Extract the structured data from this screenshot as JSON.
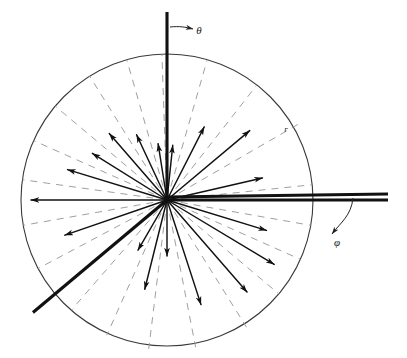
{
  "figure": {
    "type": "polar-vector-diagram",
    "title": "",
    "background_color": "#ffffff",
    "width": 407,
    "height": 358
  },
  "labels": {
    "theta": "θ",
    "phi": "φ",
    "radius": "r"
  },
  "colors": {
    "stroke": "#111111",
    "circle": "#3a3a3a",
    "dashed": "#9a9a9a",
    "axis": "#111111",
    "label": "#1a1a1a"
  },
  "chart_data": {
    "type": "scatter",
    "title": "",
    "xlabel": "φ",
    "ylabel": "θ",
    "grid": false,
    "legend": null,
    "center": {
      "x": 167,
      "y": 200
    },
    "boundary_circle": {
      "cx": 167,
      "cy": 200,
      "r": 146
    },
    "axes": [
      {
        "name": "theta-axis",
        "label": "θ",
        "orientation": "vertical",
        "from": {
          "x": 167,
          "y": 12
        },
        "to": {
          "x": 167,
          "y": 200
        },
        "label_pos": {
          "x": 199,
          "y": 31
        },
        "arc_arrow": {
          "from": {
            "x": 170,
            "y": 27
          },
          "to": {
            "x": 193,
            "y": 29
          }
        }
      },
      {
        "name": "phi-axis",
        "label": "φ",
        "orientation": "horizontal",
        "from": {
          "x": 167,
          "y": 197
        },
        "to": {
          "x": 388,
          "y": 194
        },
        "label_pos": {
          "x": 337,
          "y": 243
        },
        "arc_arrow": {
          "from": {
            "x": 353,
            "y": 198
          },
          "to": {
            "x": 332,
            "y": 234
          }
        }
      }
    ],
    "radius_marker": {
      "label": "r",
      "pos": {
        "x": 286,
        "y": 130
      },
      "angle_deg": 30
    },
    "comment": "Vectors radiate from the center; angle_deg measured counterclockwise from the +x axis, length_px is the drawn arrow length in pixels.",
    "vectors": [
      {
        "angle_deg": 180.0,
        "length_px": 136,
        "weight": "thin",
        "arrow": true
      },
      {
        "angle_deg": 163.0,
        "length_px": 104,
        "weight": "thin",
        "arrow": true
      },
      {
        "angle_deg": 148.0,
        "length_px": 88,
        "weight": "thin",
        "arrow": true
      },
      {
        "angle_deg": 131.0,
        "length_px": 88,
        "weight": "thin",
        "arrow": true
      },
      {
        "angle_deg": 115.0,
        "length_px": 72,
        "weight": "thin",
        "arrow": true
      },
      {
        "angle_deg": 99.0,
        "length_px": 57,
        "weight": "thin",
        "arrow": true
      },
      {
        "angle_deg": 84.0,
        "length_px": 55,
        "weight": "thin",
        "arrow": true
      },
      {
        "angle_deg": 63.0,
        "length_px": 82,
        "weight": "thin",
        "arrow": true
      },
      {
        "angle_deg": 40.0,
        "length_px": 108,
        "weight": "thin",
        "arrow": true
      },
      {
        "angle_deg": 13.0,
        "length_px": 98,
        "weight": "thin",
        "arrow": true
      },
      {
        "angle_deg": 0.0,
        "length_px": 221,
        "weight": "thick",
        "arrow": false
      },
      {
        "angle_deg": -17.0,
        "length_px": 104,
        "weight": "thin",
        "arrow": true
      },
      {
        "angle_deg": -31.0,
        "length_px": 125,
        "weight": "thin",
        "arrow": true
      },
      {
        "angle_deg": -49.0,
        "length_px": 122,
        "weight": "thin",
        "arrow": true
      },
      {
        "angle_deg": -72.0,
        "length_px": 110,
        "weight": "thin",
        "arrow": true
      },
      {
        "angle_deg": -90.0,
        "length_px": 56,
        "weight": "thin",
        "arrow": true
      },
      {
        "angle_deg": -104.0,
        "length_px": 92,
        "weight": "thin",
        "arrow": true
      },
      {
        "angle_deg": -120.0,
        "length_px": 58,
        "weight": "thin",
        "arrow": true
      },
      {
        "angle_deg": -140.0,
        "length_px": 175,
        "weight": "thick",
        "arrow": false
      },
      {
        "angle_deg": -161.0,
        "length_px": 108,
        "weight": "thin",
        "arrow": true
      }
    ],
    "dashed_rays": [
      {
        "angle_deg": 172.0,
        "length_px": 146
      },
      {
        "angle_deg": 156.0,
        "length_px": 146
      },
      {
        "angle_deg": 140.0,
        "length_px": 146
      },
      {
        "angle_deg": 122.0,
        "length_px": 146
      },
      {
        "angle_deg": 106.0,
        "length_px": 146
      },
      {
        "angle_deg": 92.0,
        "length_px": 146
      },
      {
        "angle_deg": 74.0,
        "length_px": 146
      },
      {
        "angle_deg": 52.0,
        "length_px": 146
      },
      {
        "angle_deg": 30.0,
        "length_px": 152
      },
      {
        "angle_deg": 6.0,
        "length_px": 146
      },
      {
        "angle_deg": -10.0,
        "length_px": 146
      },
      {
        "angle_deg": -24.0,
        "length_px": 146
      },
      {
        "angle_deg": -40.0,
        "length_px": 146
      },
      {
        "angle_deg": -58.0,
        "length_px": 150
      },
      {
        "angle_deg": -79.0,
        "length_px": 150
      },
      {
        "angle_deg": -97.0,
        "length_px": 150
      },
      {
        "angle_deg": -114.0,
        "length_px": 148
      },
      {
        "angle_deg": -131.0,
        "length_px": 146
      },
      {
        "angle_deg": -152.0,
        "length_px": 146
      },
      {
        "angle_deg": -170.0,
        "length_px": 146
      }
    ]
  }
}
